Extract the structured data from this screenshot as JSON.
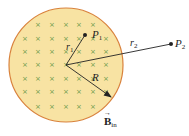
{
  "diagram": {
    "region": {
      "fill": "#f8e3a3",
      "stroke": "#d9823c",
      "cx": 66,
      "cy": 65,
      "r": 57
    },
    "field_marker": {
      "symbol": "×",
      "color": "#6a9a4a"
    },
    "field_grid": {
      "rows": [
        24,
        38,
        51,
        64,
        78,
        91,
        106
      ],
      "cols": [
        25,
        38,
        52,
        66,
        79,
        93,
        106,
        119
      ]
    },
    "labels": {
      "p1": "P",
      "p1_sub": "1",
      "p2": "P",
      "p2_sub": "2",
      "r1": "r",
      "r1_sub": "1",
      "r2": "r",
      "r2_sub": "2",
      "R": "R",
      "B": "B",
      "B_sub": "in",
      "B_arrow": "→"
    },
    "points": {
      "center": [
        66,
        65
      ],
      "p1": [
        85,
        35
      ],
      "p2": [
        171,
        44
      ],
      "arrow_tip": [
        111,
        97
      ]
    }
  }
}
